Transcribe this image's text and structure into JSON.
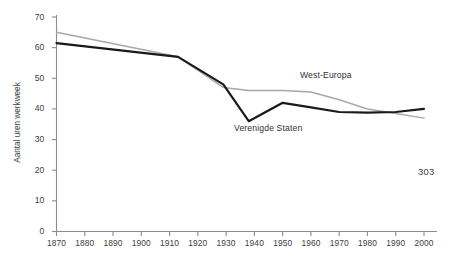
{
  "page": {
    "page_number": "303"
  },
  "chart_data": {
    "type": "line",
    "title": "",
    "xlabel": "",
    "ylabel": "Aantal uren werkweek",
    "xlim": [
      1870,
      2000
    ],
    "ylim": [
      0,
      70
    ],
    "grid": false,
    "legend_position": "inline-annotations",
    "xticks": [
      1870,
      1880,
      1890,
      1900,
      1910,
      1920,
      1930,
      1940,
      1950,
      1960,
      1970,
      1980,
      1990,
      2000
    ],
    "xtick_labels": [
      "1870",
      "1880",
      "1890",
      "1900",
      "1910",
      "1920",
      "1930",
      "1940",
      "1950",
      "1960",
      "1970",
      "1980",
      "1990",
      "2000"
    ],
    "yticks": [
      0,
      10,
      20,
      30,
      40,
      50,
      60,
      70
    ],
    "ytick_labels": [
      "0",
      "10",
      "20",
      "30",
      "40",
      "50",
      "60",
      "70"
    ],
    "series": [
      {
        "name": "West-Europa",
        "color": "#a8a8a8",
        "label_text": "West-Europa",
        "x": [
          1870,
          1913,
          1929,
          1938,
          1950,
          1960,
          1970,
          1980,
          1990,
          2000
        ],
        "values": [
          65,
          57,
          47,
          46,
          46,
          45.5,
          43,
          40,
          38.5,
          37
        ]
      },
      {
        "name": "Verenigde Staten",
        "color": "#1a1a1a",
        "label_text": "Verenigde Staten",
        "x": [
          1870,
          1913,
          1929,
          1938,
          1950,
          1960,
          1970,
          1980,
          1990,
          2000
        ],
        "values": [
          61.5,
          57,
          48,
          36,
          42,
          40.5,
          39,
          38.8,
          39,
          40
        ]
      }
    ]
  }
}
